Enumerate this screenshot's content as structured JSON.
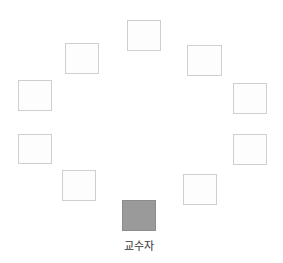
{
  "diagram": {
    "type": "seating-arrangement",
    "colors": {
      "seat_fill": "#fdfdfd",
      "seat_border": "#cfcfcf",
      "instructor_fill": "#9a9a9a",
      "label": "#333333"
    },
    "seats": [
      {
        "id": "seat-1",
        "x": 127,
        "y": 20,
        "w": 34,
        "h": 31
      },
      {
        "id": "seat-2",
        "x": 65,
        "y": 43,
        "w": 34,
        "h": 31
      },
      {
        "id": "seat-3",
        "x": 187,
        "y": 45,
        "w": 35,
        "h": 31
      },
      {
        "id": "seat-4",
        "x": 18,
        "y": 80,
        "w": 34,
        "h": 31
      },
      {
        "id": "seat-5",
        "x": 233,
        "y": 83,
        "w": 34,
        "h": 31
      },
      {
        "id": "seat-6",
        "x": 18,
        "y": 134,
        "w": 34,
        "h": 30
      },
      {
        "id": "seat-7",
        "x": 233,
        "y": 134,
        "w": 34,
        "h": 31
      },
      {
        "id": "seat-8",
        "x": 62,
        "y": 170,
        "w": 34,
        "h": 31
      },
      {
        "id": "seat-9",
        "x": 183,
        "y": 174,
        "w": 34,
        "h": 31
      }
    ],
    "instructor": {
      "x": 122,
      "y": 200,
      "w": 34,
      "h": 31,
      "label": "교수자"
    }
  }
}
